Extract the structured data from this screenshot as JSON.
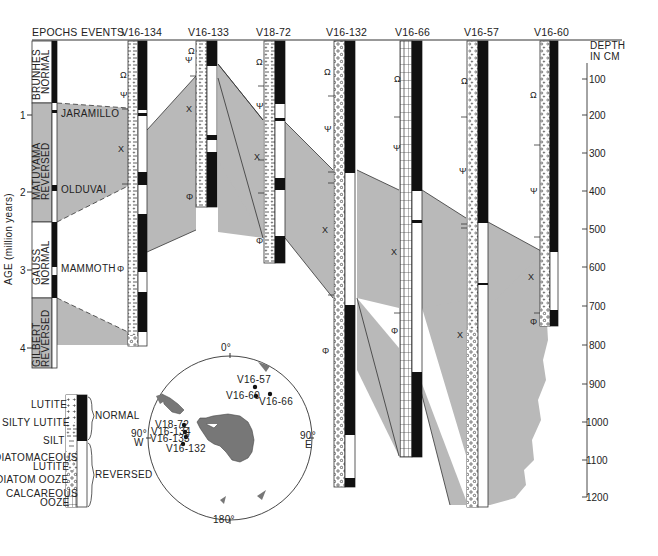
{
  "header": {
    "epochs": "EPOCHS",
    "events": "EVENTS",
    "depth_line1": "DEPTH",
    "depth_line2": "IN CM"
  },
  "age_axis": {
    "label": "AGE (million years)",
    "ticks": [
      "1",
      "2",
      "3",
      "4"
    ]
  },
  "depth_axis": {
    "ticks": [
      "100",
      "200",
      "300",
      "400",
      "500",
      "600",
      "700",
      "800",
      "900",
      "1000",
      "1100",
      "1200"
    ]
  },
  "epochs": [
    {
      "line1": "BRUNHES",
      "line2": "NORMAL"
    },
    {
      "line1": "MATUYAMA",
      "line2": "REVERSED"
    },
    {
      "line1": "GAUSS",
      "line2": "NORMAL"
    },
    {
      "line1": "GILBERT",
      "line2": "REVERSED"
    }
  ],
  "events": [
    "JARAMILLO",
    "OLDUVAI",
    "MAMMOTH"
  ],
  "cores": [
    {
      "id": "V16-134",
      "depth_cm": 760
    },
    {
      "id": "V16-133",
      "depth_cm": 410
    },
    {
      "id": "V18-72",
      "depth_cm": 610
    },
    {
      "id": "V16-132",
      "depth_cm": 1160
    },
    {
      "id": "V16-66",
      "depth_cm": 1080
    },
    {
      "id": "V16-57",
      "depth_cm": 1190
    },
    {
      "id": "V16-60",
      "depth_cm": 760
    }
  ],
  "legend": {
    "lithology": [
      "LUTITE",
      "SILTY LUTITE",
      "SILT",
      "DIATOMACEOUS",
      "LUTITE",
      "DIATOM OOZE",
      "CALCAREOUS",
      "OOZE"
    ],
    "polarity": [
      "NORMAL",
      "REVERSED"
    ]
  },
  "map": {
    "top": "0°",
    "left": "90°",
    "left_dir": "W",
    "right": "90°",
    "right_dir": "E",
    "bottom": "180°",
    "stations": [
      "V16-57",
      "V16-60",
      "V16-66",
      "V18-72",
      "V16-134",
      "V16-133",
      "V16-132"
    ]
  },
  "symbols": {
    "omega": "Ω",
    "psi": "Ψ",
    "cross": "X",
    "phi": "Φ"
  },
  "colors": {
    "shade": "#b9b9b9",
    "black": "#111111",
    "land": "#777777"
  }
}
